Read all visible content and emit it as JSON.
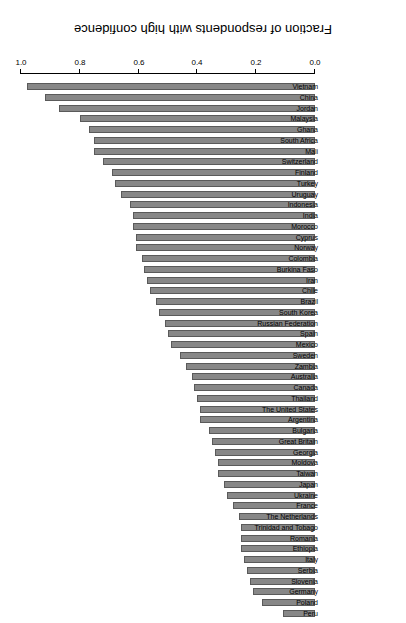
{
  "chart_data": {
    "type": "bar",
    "orientation": "horizontal",
    "title": "",
    "subtitle": "",
    "xlabel": "Fraction of respondents with high confidence",
    "ylabel": "",
    "xlim": [
      0.0,
      1.0
    ],
    "xticks": [
      "0.0",
      "0.2",
      "0.4",
      "0.6",
      "0.8",
      "1.0"
    ],
    "xtick_values": [
      0.0,
      0.2,
      0.4,
      0.6,
      0.8,
      1.0
    ],
    "grid": false,
    "legend": null,
    "bar_color": "#878787",
    "bar_border_color": "#5a5a5a",
    "categories": [
      "Vietnam",
      "China",
      "Jordan",
      "Malaysia",
      "Ghana",
      "South Africa",
      "Mali",
      "Switzerland",
      "Finland",
      "Turkey",
      "Uruguay",
      "Indonesia",
      "India",
      "Morocco",
      "Cyprus",
      "Norway",
      "Colombia",
      "Burkina Faso",
      "Iran",
      "Chile",
      "Brazil",
      "South Korea",
      "Russian Federation",
      "Spain",
      "Mexico",
      "Sweden",
      "Zambia",
      "Australia",
      "Canada",
      "Thailand",
      "The United States",
      "Argentina",
      "Bulgaria",
      "Great Britain",
      "Georgia",
      "Moldova",
      "Taiwan",
      "Japan",
      "Ukraine",
      "France",
      "The Netherlands",
      "Trinidad and Tobago",
      "Romania",
      "Ethiopia",
      "Italy",
      "Serbia",
      "Slovenia",
      "Germany",
      "Poland",
      "Peru"
    ],
    "values": [
      0.98,
      0.92,
      0.87,
      0.8,
      0.77,
      0.75,
      0.75,
      0.72,
      0.69,
      0.68,
      0.66,
      0.63,
      0.62,
      0.62,
      0.61,
      0.61,
      0.59,
      0.58,
      0.57,
      0.56,
      0.54,
      0.53,
      0.51,
      0.5,
      0.49,
      0.46,
      0.44,
      0.42,
      0.41,
      0.4,
      0.39,
      0.39,
      0.36,
      0.35,
      0.34,
      0.33,
      0.33,
      0.31,
      0.3,
      0.28,
      0.26,
      0.25,
      0.25,
      0.25,
      0.24,
      0.23,
      0.22,
      0.21,
      0.18,
      0.11
    ]
  },
  "axis": {
    "x_title": "Fraction of respondents with high confidence"
  }
}
